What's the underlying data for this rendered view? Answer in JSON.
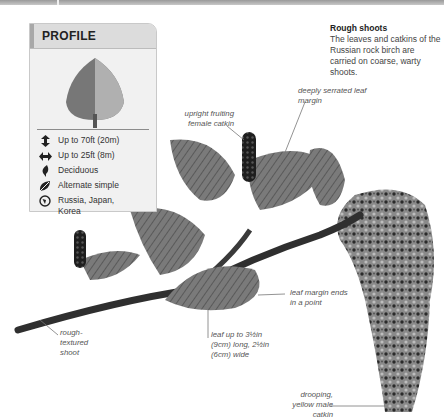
{
  "profile": {
    "title": "PROFILE",
    "stats": [
      {
        "icon": "height-icon",
        "text": "Up to 70ft (20m)"
      },
      {
        "icon": "spread-icon",
        "text": "Up to 25ft (8m)"
      },
      {
        "icon": "deciduous-leaf-icon",
        "text": "Deciduous"
      },
      {
        "icon": "leaf-arrangement-icon",
        "text": "Alternate simple"
      },
      {
        "icon": "globe-icon",
        "text": "Russia, Japan, Korea"
      }
    ]
  },
  "caption": {
    "title": "Rough shoots",
    "body": "The leaves and catkins of the Russian rock birch are carried on coarse, warty shoots."
  },
  "annotations": {
    "deeply_serrated": "deeply serrated leaf margin",
    "upright_catkin": "upright fruiting female catkin",
    "leaf_margin_point": "leaf margin ends in a point",
    "rough_shoot": "rough-textured shoot",
    "leaf_size": "leaf up to 3½in (9cm) long, 2½in (6cm) wide",
    "male_catkin": "drooping, yellow male catkin"
  }
}
